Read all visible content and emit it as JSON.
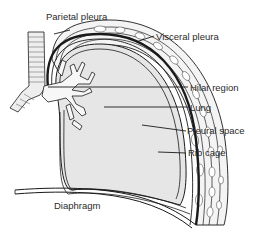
{
  "diagram": {
    "labels": {
      "parietal_pleura": "Parietal pleura",
      "visceral_pleura": "Visceral pleura",
      "hilar_region": "Hilar region",
      "lung": "Lung",
      "pleural_space": "Pleural space",
      "rib_cage": "Rib cage",
      "diaphragm": "Diaphragm"
    },
    "colors": {
      "lung_fill": "#e6e6e6",
      "outline": "#1a1a1a",
      "rib_fill": "#f2f2f2",
      "background": "#ffffff"
    }
  }
}
